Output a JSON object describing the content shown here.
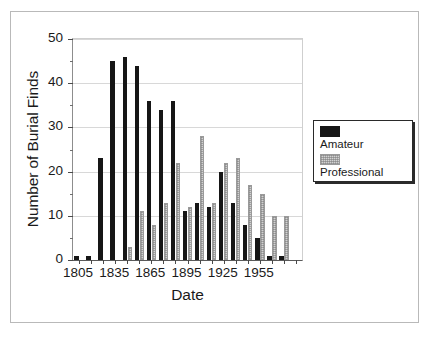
{
  "chart_data": {
    "type": "bar",
    "title": "",
    "xlabel": "Date",
    "ylabel": "Number of Burial Finds",
    "ylim": [
      0,
      50
    ],
    "yticks": [
      0,
      10,
      20,
      30,
      40,
      50
    ],
    "ytick_labels": [
      "0",
      "10",
      "20",
      "30",
      "40",
      "50"
    ],
    "y_minor_ticks": [
      5,
      15,
      25,
      35,
      45
    ],
    "grid": "horizontal",
    "legend_position": "right-outside",
    "categories": [
      1805,
      1815,
      1825,
      1835,
      1845,
      1855,
      1865,
      1875,
      1885,
      1895,
      1905,
      1915,
      1925,
      1935,
      1945,
      1955,
      1965,
      1975,
      1985
    ],
    "xtick_labels": [
      "1805",
      "1835",
      "1865",
      "1895",
      "1925",
      "1955"
    ],
    "xtick_categories": [
      1805,
      1835,
      1865,
      1895,
      1925,
      1955
    ],
    "series": [
      {
        "name": "Amateur",
        "color": "#161616",
        "values": [
          1,
          1,
          23,
          45,
          46,
          44,
          36,
          34,
          36,
          11,
          13,
          12,
          20,
          13,
          8,
          5,
          1,
          1,
          0
        ]
      },
      {
        "name": "Professional",
        "color": "#d2d2d2",
        "values": [
          0,
          0,
          0,
          0,
          3,
          11,
          8,
          13,
          22,
          12,
          28,
          13,
          22,
          23,
          17,
          15,
          10,
          10,
          0
        ]
      }
    ]
  },
  "legend": {
    "entries": [
      {
        "label": "Amateur",
        "swatch": "amateur-swatch"
      },
      {
        "label": "Professional",
        "swatch": "professional-swatch"
      }
    ]
  }
}
